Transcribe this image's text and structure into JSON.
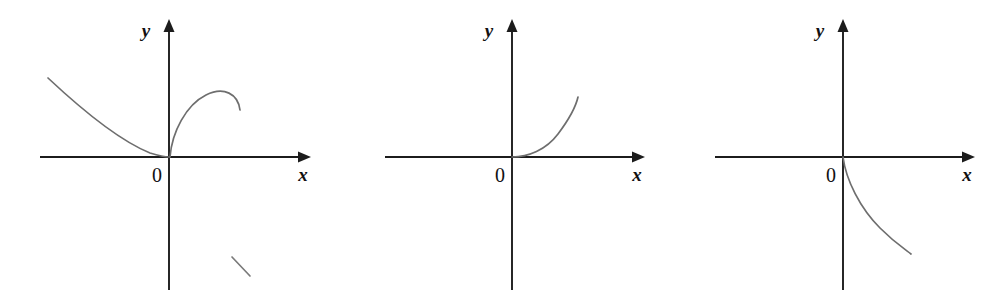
{
  "figure": {
    "kind": "math-coordinate-axes-figure",
    "panel_count": 3,
    "background_color": "#ffffff",
    "axis_color": "#1c1c1c",
    "curve_color": "#6e6e6e",
    "label_color": "#111111"
  },
  "panels": [
    {
      "id": "panel-1",
      "name": "left-panel",
      "x_axis_label": "x",
      "y_axis_label": "y",
      "origin_label": "0",
      "curves": [
        {
          "name": "left-descending-branch",
          "description": "decreasing convex curve from upper-left meeting the origin tangentially from the left",
          "path": "M 48 78 C 80 108, 118 140, 150 153 C 160 156, 165 157, 169 157"
        },
        {
          "name": "right-arch-branch",
          "description": "steeply rising branch from the origin reaching a maximum then turning back down",
          "path": "M 170 157 C 172 132, 186 105, 206 95 C 224 86, 238 94, 240 110"
        }
      ],
      "stray_marks": [
        {
          "name": "stray-pen-stroke",
          "path": "M 232 257 L 250 276"
        }
      ],
      "geometry": {
        "origin_x": 169,
        "origin_y": 157,
        "x_axis_start": 40,
        "x_axis_end": 298,
        "y_axis_top": 22,
        "y_axis_bottom": 290
      }
    },
    {
      "id": "panel-2",
      "name": "middle-panel",
      "x_axis_label": "x",
      "y_axis_label": "y",
      "origin_label": "0",
      "curves": [
        {
          "name": "rising-branch",
          "description": "curve leaving the origin tangent to the x-axis then rising steeply to the right",
          "path": "M 172 157 C 188 157, 206 150, 218 134 C 230 118, 236 106, 238 97"
        }
      ],
      "stray_marks": [],
      "geometry": {
        "origin_x": 172,
        "origin_y": 157,
        "x_axis_start": 45,
        "x_axis_end": 298,
        "y_axis_top": 22,
        "y_axis_bottom": 290
      }
    },
    {
      "id": "panel-3",
      "name": "right-panel",
      "x_axis_label": "x",
      "y_axis_label": "y",
      "origin_label": "0",
      "curves": [
        {
          "name": "falling-branch",
          "description": "curve leaving the origin tangent to the y-axis then falling and flattening into the fourth quadrant",
          "path": "M 173 157 C 176 180, 190 208, 210 228 C 226 244, 236 250, 241 254"
        }
      ],
      "stray_marks": [],
      "geometry": {
        "origin_x": 173,
        "origin_y": 157,
        "x_axis_start": 45,
        "x_axis_end": 305,
        "y_axis_top": 22,
        "y_axis_bottom": 290
      }
    }
  ],
  "chart_data": {
    "type": "line",
    "title": "",
    "xlabel": "x",
    "ylabel": "y",
    "grid": false,
    "legend": "none",
    "subplots": [
      {
        "name": "left-panel",
        "origin_label": "0",
        "series": [
          {
            "name": "left-descending-branch",
            "shape": "decreasing-convex-to-origin",
            "x": [
              -5.0,
              -4.0,
              -3.0,
              -2.0,
              -1.0,
              -0.5,
              0.0
            ],
            "y": [
              3.1,
              2.3,
              1.55,
              0.85,
              0.28,
              0.1,
              0.0
            ]
          },
          {
            "name": "right-arch-branch",
            "shape": "rise-peak-fall",
            "x": [
              0.0,
              0.3,
              0.7,
              1.1,
              1.5,
              1.9,
              2.3,
              2.6
            ],
            "y": [
              0.0,
              0.85,
              1.45,
              1.82,
              1.98,
              1.9,
              1.6,
              1.25
            ]
          }
        ]
      },
      {
        "name": "middle-panel",
        "origin_label": "0",
        "series": [
          {
            "name": "rising-branch",
            "shape": "increasing-convex-from-origin",
            "x": [
              0.0,
              0.5,
              1.0,
              1.5,
              2.0,
              2.4,
              2.7
            ],
            "y": [
              0.0,
              0.04,
              0.2,
              0.6,
              1.35,
              2.05,
              2.55
            ]
          }
        ]
      },
      {
        "name": "right-panel",
        "origin_label": "0",
        "series": [
          {
            "name": "falling-branch",
            "shape": "decreasing-concave-from-origin",
            "x": [
              0.0,
              0.15,
              0.4,
              0.8,
              1.3,
              1.9,
              2.5,
              2.9
            ],
            "y": [
              0.0,
              -0.45,
              -0.9,
              -1.4,
              -1.85,
              -2.3,
              -2.6,
              -2.75
            ]
          }
        ]
      }
    ]
  }
}
